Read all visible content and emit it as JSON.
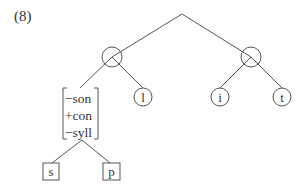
{
  "example_number": "(8)",
  "tree": {
    "root": {
      "type": "vertex"
    },
    "branches": [
      {
        "type": "circle-node",
        "label": "",
        "children": [
          {
            "type": "feature-matrix",
            "features": [
              "−son",
              "+con",
              "−syll"
            ],
            "children": [
              {
                "type": "box-node",
                "label": "s"
              },
              {
                "type": "box-node",
                "label": "p"
              }
            ]
          },
          {
            "type": "circle-node",
            "label": "l"
          }
        ]
      },
      {
        "type": "circle-node",
        "label": "",
        "children": [
          {
            "type": "circle-node",
            "label": "i"
          },
          {
            "type": "circle-node",
            "label": "t"
          }
        ]
      }
    ]
  },
  "labels": {
    "feature_1": "−son",
    "feature_2": "+con",
    "feature_3": "−syll",
    "leaf_s": "s",
    "leaf_p": "p",
    "leaf_l": "l",
    "leaf_i": "i",
    "leaf_t": "t"
  }
}
